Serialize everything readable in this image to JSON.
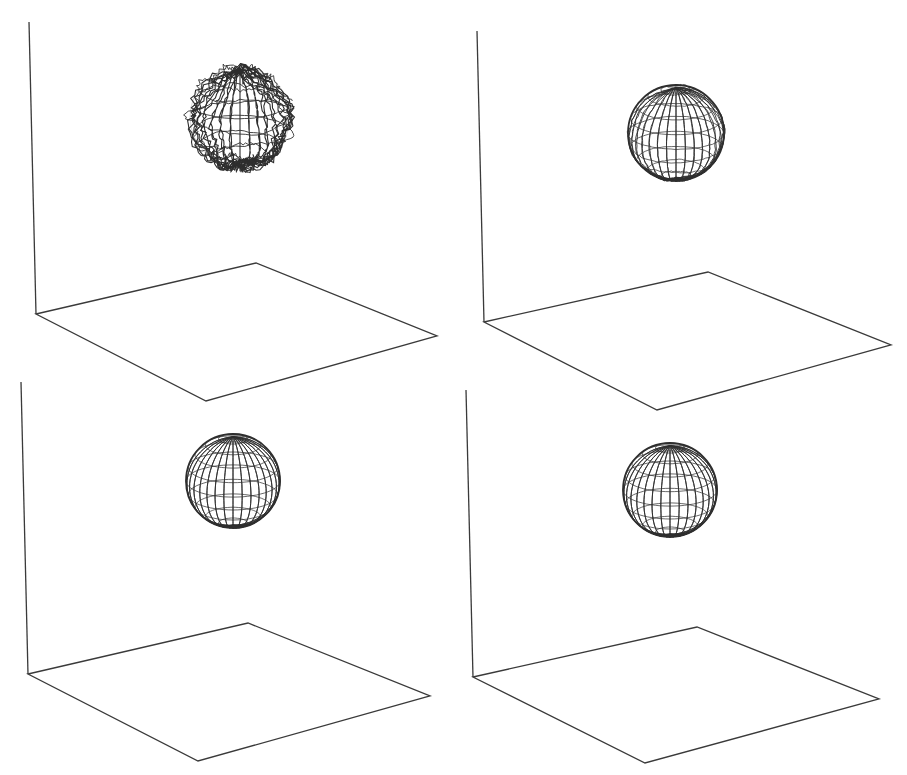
{
  "figure": {
    "caption": "",
    "colors": {
      "background": "#ffffff",
      "line": "#2e2e2e",
      "axis": "#3a3a3a"
    }
  },
  "panels": [
    {
      "id": "top-left",
      "label": "Irregular noisy wireframe blob",
      "stage": 1,
      "vertical_axis": [
        [
          29,
          22
        ],
        [
          36,
          314
        ]
      ],
      "floor": [
        [
          36,
          314
        ],
        [
          256,
          263
        ],
        [
          437,
          336
        ],
        [
          206,
          401
        ]
      ],
      "sphere": {
        "cx": 240,
        "cy": 117,
        "r": 50,
        "noise": 0.12
      }
    },
    {
      "id": "top-right",
      "label": "Nearly smooth wireframe sphere with slight distortion",
      "stage": 2,
      "vertical_axis": [
        [
          477,
          31
        ],
        [
          484,
          322
        ]
      ],
      "floor": [
        [
          484,
          322
        ],
        [
          708,
          272
        ],
        [
          891,
          345
        ],
        [
          657,
          410
        ]
      ],
      "sphere": {
        "cx": 676,
        "cy": 133,
        "r": 48,
        "noise": 0.025
      }
    },
    {
      "id": "bottom-left",
      "label": "Smooth wireframe sphere",
      "stage": 3,
      "vertical_axis": [
        [
          21,
          382
        ],
        [
          28,
          674
        ]
      ],
      "floor": [
        [
          28,
          674
        ],
        [
          248,
          623
        ],
        [
          430,
          696
        ],
        [
          198,
          761
        ]
      ],
      "sphere": {
        "cx": 233,
        "cy": 481,
        "r": 47,
        "noise": 0.0
      }
    },
    {
      "id": "bottom-right",
      "label": "Smooth wireframe sphere",
      "stage": 4,
      "vertical_axis": [
        [
          466,
          390
        ],
        [
          473,
          677
        ]
      ],
      "floor": [
        [
          473,
          677
        ],
        [
          697,
          627
        ],
        [
          879,
          699
        ],
        [
          645,
          763
        ]
      ],
      "sphere": {
        "cx": 670,
        "cy": 490,
        "r": 47,
        "noise": 0.0
      }
    }
  ]
}
